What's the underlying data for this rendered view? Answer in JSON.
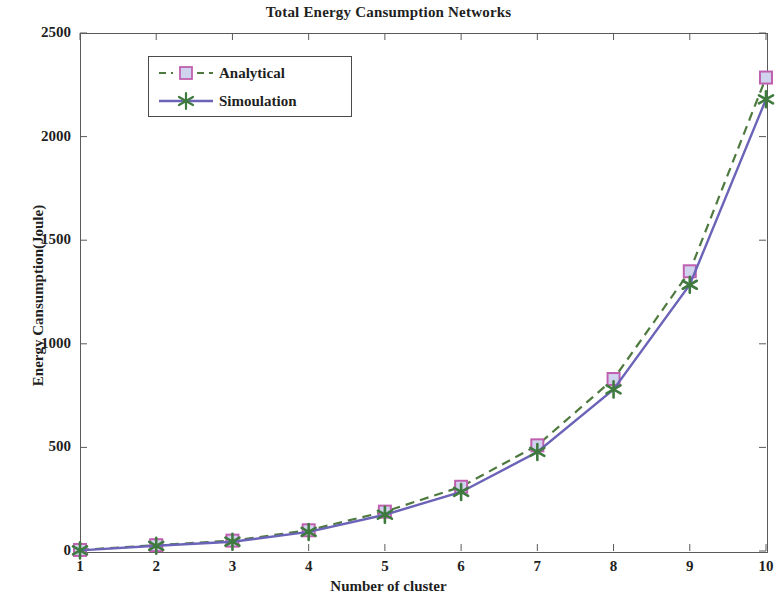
{
  "chart_data": {
    "type": "line",
    "title": "Total Energy Cansumption Networks",
    "xlabel": "Number of cluster",
    "ylabel": "Energy Cansumption(Joule)",
    "x": [
      1,
      2,
      3,
      4,
      5,
      6,
      7,
      8,
      9,
      10
    ],
    "xlim": [
      1,
      10
    ],
    "ylim": [
      0,
      2500
    ],
    "xticks": [
      "1",
      "2",
      "3",
      "4",
      "5",
      "6",
      "7",
      "8",
      "9",
      "10"
    ],
    "yticks": [
      "0",
      "500",
      "1000",
      "1500",
      "2000",
      "2500"
    ],
    "ytick_values": [
      0,
      500,
      1000,
      1500,
      2000,
      2500
    ],
    "grid": false,
    "legend_position": "upper left",
    "series": [
      {
        "name": "Analytical",
        "values": [
          5,
          28,
          50,
          100,
          190,
          310,
          510,
          830,
          1350,
          2285
        ],
        "line_style": "dashed",
        "line_color": "#4f7a3f",
        "marker": "square",
        "marker_edge_color": "#c060b0",
        "marker_face_color": "#cfd3ee"
      },
      {
        "name": "Simoulation",
        "values": [
          3,
          25,
          45,
          92,
          175,
          285,
          478,
          780,
          1285,
          2180
        ],
        "line_style": "solid",
        "line_color": "#6a63b8",
        "marker": "star",
        "marker_edge_color": "#3f7a3f",
        "marker_face_color": "#4f8a4f"
      }
    ]
  },
  "legend": {
    "entries": [
      {
        "label": "Analytical"
      },
      {
        "label": "Simoulation"
      }
    ]
  },
  "colors": {
    "analytical_line": "#4f7a3f",
    "analytical_marker_edge": "#c060b0",
    "analytical_marker_face": "#cfd3ee",
    "simulation_line": "#6a63b8",
    "simulation_marker": "#3f7a3f",
    "axis": "#5a5a5a",
    "text": "#1f1f1f",
    "background": "#ffffff"
  }
}
